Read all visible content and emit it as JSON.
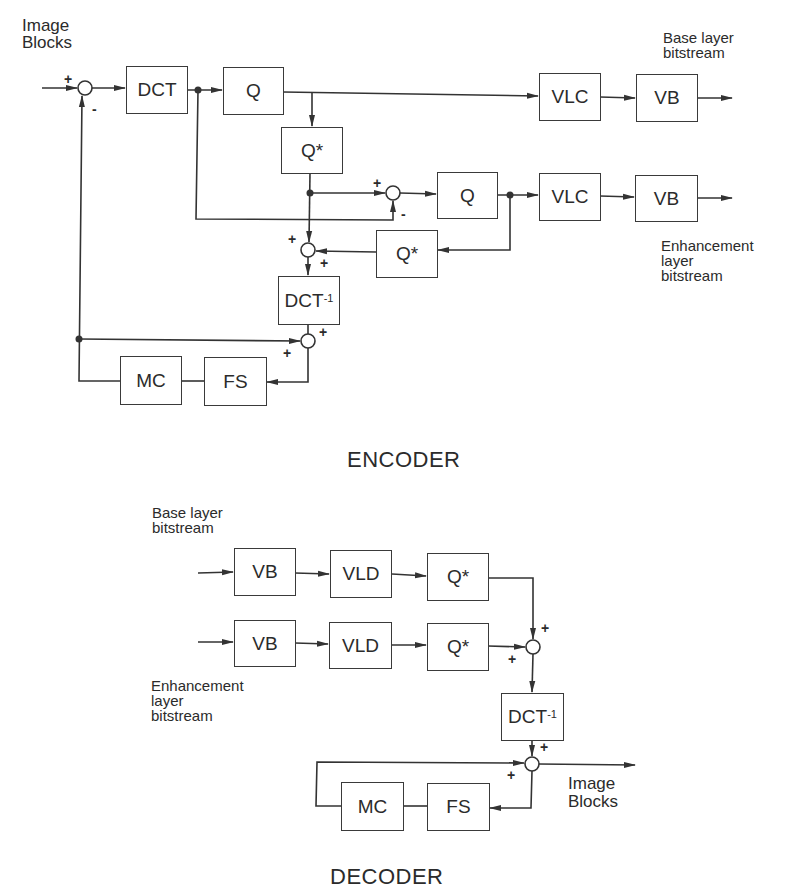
{
  "encoder": {
    "title": "ENCODER",
    "input_label": "Image\nBlocks",
    "base_output_label": "Base layer\nbitstream",
    "enh_output_label": "Enhancement\nlayer\nbitstream",
    "blocks": {
      "dct": "DCT",
      "q_base": "Q",
      "qstar_base": "Q*",
      "vlc_base": "VLC",
      "vb_base": "VB",
      "q_enh": "Q",
      "vlc_enh": "VLC",
      "vb_enh": "VB",
      "qstar_enh": "Q*",
      "idct": "DCT",
      "idct_sup": "-1",
      "mc": "MC",
      "fs": "FS"
    },
    "signs": {
      "s1_in": "+",
      "s1_fb": "-",
      "s2_top": "+",
      "s2_bottom": "-",
      "s3_top": "+",
      "s3_right": "+",
      "s4_top": "+",
      "s4_left": "+"
    }
  },
  "decoder": {
    "title": "DECODER",
    "base_input_label": "Base layer\nbitstream",
    "enh_input_label": "Enhancement\nlayer\nbitstream",
    "output_label": "Image\nBlocks",
    "blocks": {
      "vb_base": "VB",
      "vld_base": "VLD",
      "qstar_base": "Q*",
      "vb_enh": "VB",
      "vld_enh": "VLD",
      "qstar_enh": "Q*",
      "idct": "DCT",
      "idct_sup": "-1",
      "mc": "MC",
      "fs": "FS"
    },
    "signs": {
      "s1_top": "+",
      "s1_left": "+",
      "s2_top": "+",
      "s2_left": "+"
    }
  },
  "colors": {
    "line": "#333333",
    "background": "#ffffff"
  }
}
